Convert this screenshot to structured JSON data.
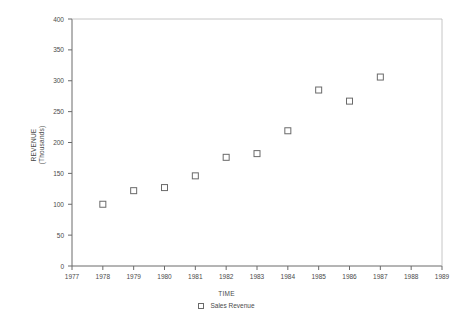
{
  "chart_data": {
    "type": "scatter",
    "title": "",
    "xlabel": "TIME",
    "ylabel": "REVENUE",
    "ylabel_line2": "(Thousands)",
    "series": [
      {
        "name": "Sales Revenue",
        "marker": "open-square",
        "x": [
          1978,
          1979,
          1980,
          1981,
          1982,
          1983,
          1984,
          1985,
          1986,
          1987
        ],
        "values": [
          100,
          122,
          127,
          146,
          176,
          182,
          219,
          285,
          267,
          306
        ]
      }
    ],
    "x_ticks": [
      1977,
      1978,
      1979,
      1980,
      1981,
      1982,
      1983,
      1984,
      1985,
      1986,
      1987,
      1988,
      1989
    ],
    "y_ticks": [
      0,
      50,
      100,
      150,
      200,
      250,
      300,
      350,
      400
    ],
    "xlim": [
      1977,
      1989
    ],
    "ylim": [
      0,
      400
    ],
    "grid": false,
    "legend_position": "bottom-center",
    "legend_entries": [
      "Sales Revenue"
    ],
    "colors": {
      "axis": "#4a4a4a",
      "marker_stroke": "#6a6a6a",
      "background": "#ffffff",
      "text": "#4a4a4a"
    }
  },
  "axes": {
    "x_title": "TIME",
    "y_title_line1": "REVENUE",
    "y_title_line2": "(Thousands)"
  },
  "legend": {
    "entry_label": "Sales Revenue"
  }
}
